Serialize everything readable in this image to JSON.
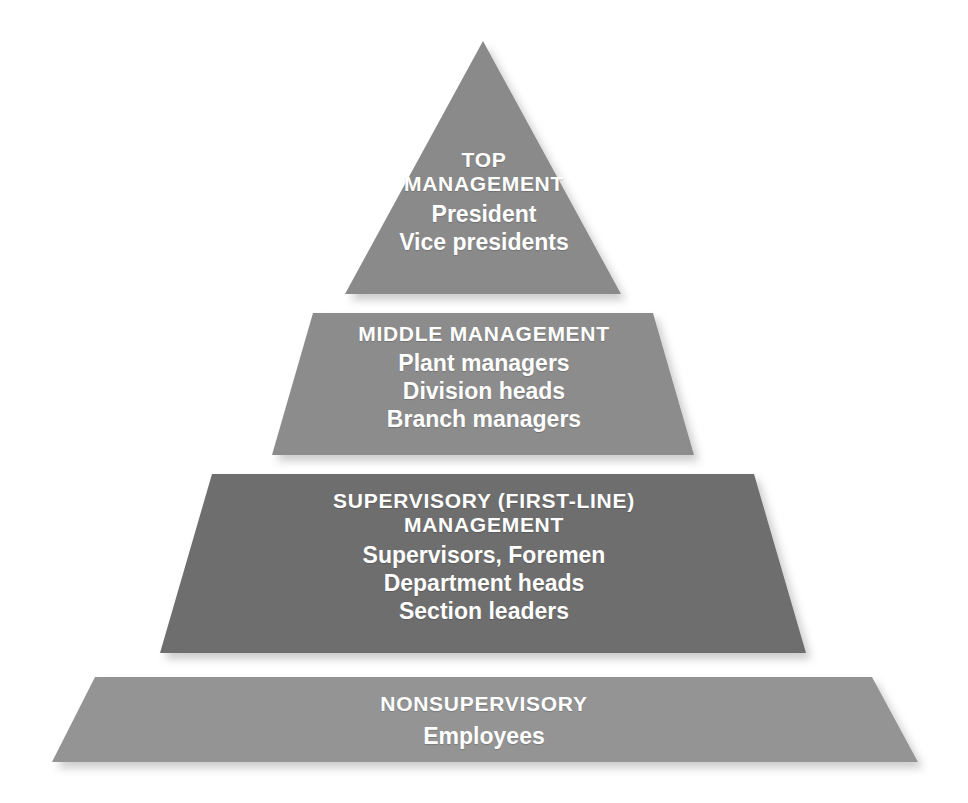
{
  "diagram": {
    "name": "Management Hierarchy Pyramid",
    "type": "pyramid",
    "background_color": "#ffffff",
    "text_color": "#ffffff",
    "levels": 4
  },
  "tiers": [
    {
      "id": "top-management",
      "rank": 1,
      "title": "TOP",
      "title_line2": "MANAGEMENT",
      "roles": [
        "President",
        "Vice presidents"
      ],
      "fill_color": "#8a8a8a"
    },
    {
      "id": "middle-management",
      "rank": 2,
      "title": "MIDDLE MANAGEMENT",
      "title_line2": "",
      "roles": [
        "Plant managers",
        "Division heads",
        "Branch managers"
      ],
      "fill_color": "#8c8c8c"
    },
    {
      "id": "supervisory-management",
      "rank": 3,
      "title": "SUPERVISORY (FIRST-LINE)",
      "title_line2": "MANAGEMENT",
      "roles": [
        "Supervisors, Foremen",
        "Department heads",
        "Section leaders"
      ],
      "fill_color": "#6e6e6e"
    },
    {
      "id": "nonsupervisory",
      "rank": 4,
      "title": "NONSUPERVISORY",
      "title_line2": "",
      "roles": [
        "Employees"
      ],
      "fill_color": "#949494"
    }
  ]
}
